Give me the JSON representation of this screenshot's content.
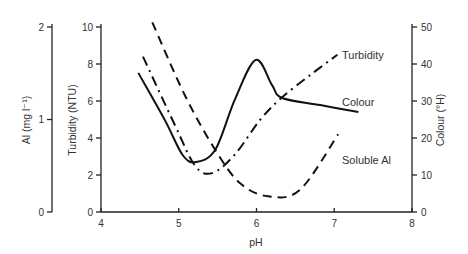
{
  "chart_data": {
    "type": "line",
    "title": "",
    "xlabel": "pH",
    "xlim": [
      4,
      8
    ],
    "x_ticks": [
      "4",
      "5",
      "6",
      "7",
      "8"
    ],
    "axes": {
      "left_outer": {
        "label": "Al (mg l⁻¹)",
        "ylim": [
          0,
          2
        ],
        "ticks": [
          "0",
          "1",
          "2"
        ]
      },
      "left_inner": {
        "label": "Turbidity (NTU)",
        "ylim": [
          0,
          10
        ],
        "ticks": [
          "0",
          "2",
          "4",
          "6",
          "8",
          "10"
        ]
      },
      "right": {
        "label": "Colour (°H)",
        "ylim": [
          0,
          50
        ],
        "ticks": [
          "0",
          "10",
          "20",
          "30",
          "40",
          "50"
        ]
      }
    },
    "grid": false,
    "legend_position": "inline labels at right end of curves",
    "series": [
      {
        "name": "Turbidity",
        "axis": "left_inner",
        "style": "dash-dot",
        "x": [
          4.54,
          4.95,
          5.21,
          5.43,
          5.72,
          6.05,
          6.33,
          6.69,
          7.04
        ],
        "y": [
          8.4,
          4.7,
          2.5,
          2.1,
          3.1,
          5.0,
          6.2,
          7.4,
          8.5
        ]
      },
      {
        "name": "Colour",
        "axis": "right",
        "style": "solid",
        "x": [
          4.48,
          4.82,
          5.05,
          5.22,
          5.47,
          5.72,
          5.99,
          6.2,
          6.33,
          6.82,
          7.31
        ],
        "y": [
          37.6,
          24.9,
          15.4,
          13.5,
          16.8,
          30.3,
          41.1,
          34.3,
          30.8,
          28.9,
          27.0
        ]
      },
      {
        "name": "Soluble Al",
        "axis": "left_outer",
        "style": "dashed",
        "x": [
          4.66,
          5.08,
          5.47,
          5.79,
          6.15,
          6.56,
          7.05
        ],
        "y": [
          2.05,
          1.26,
          0.67,
          0.31,
          0.17,
          0.24,
          0.84
        ]
      }
    ]
  },
  "labels": {
    "xlabel": "pH",
    "al_axis": "Al (mg l⁻¹)",
    "turbidity_axis": "Turbidity (NTU)",
    "colour_axis": "Colour (°H)",
    "series_turbidity": "Turbidity",
    "series_colour": "Colour",
    "series_al": "Soluble Al"
  }
}
